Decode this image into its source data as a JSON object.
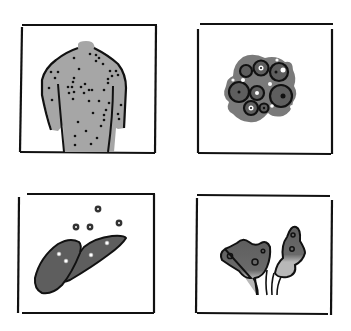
{
  "figure": {
    "colors": {
      "background": "#ffffff",
      "frame": "#111111",
      "skin_gray": "#a6a6a6",
      "dark_gray": "#5e5e5e",
      "mid_gray": "#7a7a7a",
      "light_gray": "#b8b8b8",
      "spot": "#111111"
    },
    "panels": [
      {
        "id": "top-left",
        "subject": "back-with-spots",
        "alt": "Human back covered with dark spots"
      },
      {
        "id": "top-right",
        "subject": "cell-cluster",
        "alt": "Cluster of ringed cells / vesicles"
      },
      {
        "id": "bottom-left",
        "subject": "liver-with-flowers",
        "alt": "Liver lobes with small flower-like particles"
      },
      {
        "id": "bottom-right",
        "subject": "tissue-growths",
        "alt": "Two dark irregular growths on stalks"
      }
    ]
  }
}
